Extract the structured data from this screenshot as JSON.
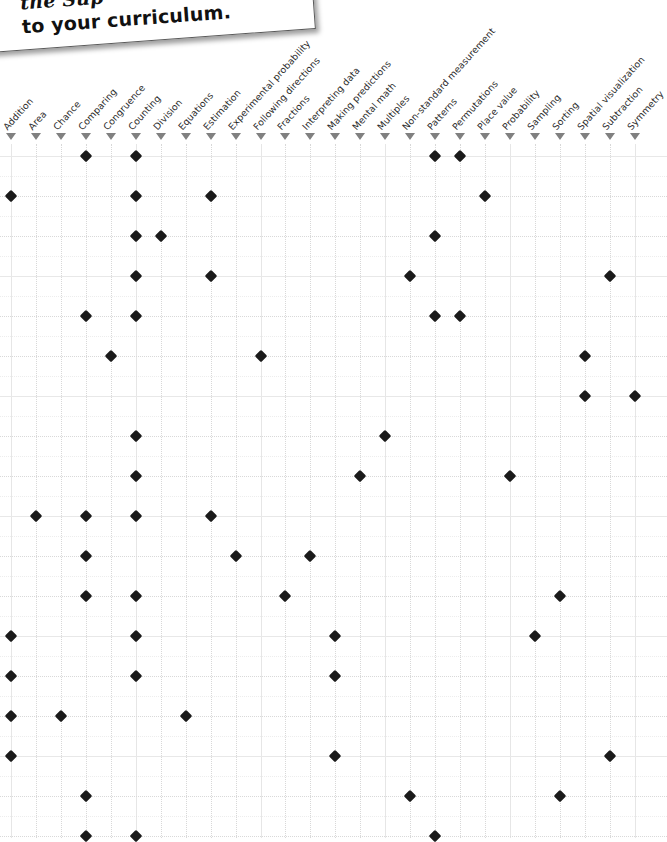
{
  "note": {
    "line1": "the Sup",
    "line2": "to your curriculum."
  },
  "matrix": {
    "columns": [
      "Addition",
      "Area",
      "Chance",
      "Comparing",
      "Congruence",
      "Counting",
      "Division",
      "Equations",
      "Estimation",
      "Experimental probability",
      "Following directions",
      "Fractions",
      "Interpreting data",
      "Making predictions",
      "Mental math",
      "Multiples",
      "Non-standard measurement",
      "Patterns",
      "Permutations",
      "Place value",
      "Probability",
      "Sampling",
      "Sorting",
      "Spatial visualization",
      "Subtraction",
      "Symmetry"
    ],
    "marker_glyph": "triangle-down",
    "dot_glyph": "diamond",
    "colors": {
      "dot": "#1a1a1a",
      "marker": "#808080",
      "gridline": "#d9d9d9",
      "gridline_major": "#e8e8e8",
      "label": "#2b2b2b"
    },
    "geometry": {
      "col_start_x": 11,
      "col_step": 24.95,
      "row_start_y": 156,
      "row_step": 40,
      "rows": 18,
      "major_every_cols": 5,
      "major_every_rows": 3
    },
    "rows": [
      {
        "index": 1,
        "cols": [
          4,
          6,
          18,
          19
        ]
      },
      {
        "index": 2,
        "cols": [
          1,
          6,
          9,
          20
        ]
      },
      {
        "index": 3,
        "cols": [
          6,
          7,
          18
        ]
      },
      {
        "index": 4,
        "cols": [
          6,
          9,
          17,
          25
        ]
      },
      {
        "index": 5,
        "cols": [
          4,
          6,
          18,
          19
        ]
      },
      {
        "index": 6,
        "cols": [
          5,
          11,
          24
        ]
      },
      {
        "index": 7,
        "cols": [
          24,
          26
        ]
      },
      {
        "index": 8,
        "cols": [
          6,
          16
        ]
      },
      {
        "index": 9,
        "cols": [
          6,
          15,
          21
        ]
      },
      {
        "index": 10,
        "cols": [
          2,
          4,
          6,
          9
        ]
      },
      {
        "index": 11,
        "cols": [
          4,
          10,
          13
        ]
      },
      {
        "index": 12,
        "cols": [
          4,
          6,
          12,
          23
        ]
      },
      {
        "index": 13,
        "cols": [
          1,
          6,
          14,
          22
        ]
      },
      {
        "index": 14,
        "cols": [
          1,
          6,
          14
        ]
      },
      {
        "index": 15,
        "cols": [
          1,
          3,
          8
        ]
      },
      {
        "index": 16,
        "cols": [
          1,
          14,
          25
        ]
      },
      {
        "index": 17,
        "cols": [
          4,
          17,
          23
        ]
      },
      {
        "index": 18,
        "cols": [
          4,
          6,
          18
        ]
      }
    ]
  }
}
